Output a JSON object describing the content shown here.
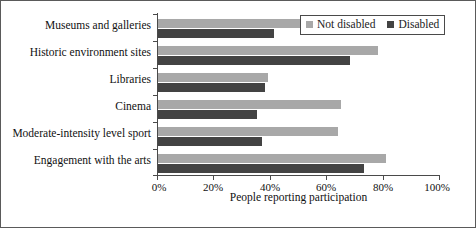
{
  "chart_data": {
    "type": "bar",
    "orientation": "horizontal",
    "title": "",
    "xlabel": "People reporting participation",
    "ylabel": "",
    "xlim": [
      0,
      100
    ],
    "xticks": [
      0,
      20,
      40,
      60,
      80,
      100
    ],
    "xtick_labels": [
      "0%",
      "20%",
      "40%",
      "60%",
      "80%",
      "100%"
    ],
    "grid": false,
    "legend_position": "top-right",
    "categories": [
      "Museums and galleries",
      "Historic environment sites",
      "Libraries",
      "Cinema",
      "Moderate-intensity level sport",
      "Engagement with the arts"
    ],
    "series": [
      {
        "name": "Not disabled",
        "color": "#a8a8a8",
        "values": [
          52,
          78,
          39,
          65,
          64,
          81
        ]
      },
      {
        "name": "Disabled",
        "color": "#434343",
        "values": [
          41,
          68,
          38,
          35,
          37,
          73
        ]
      }
    ]
  },
  "legend": {
    "entries": [
      {
        "label": "Not disabled"
      },
      {
        "label": "Disabled"
      }
    ]
  }
}
